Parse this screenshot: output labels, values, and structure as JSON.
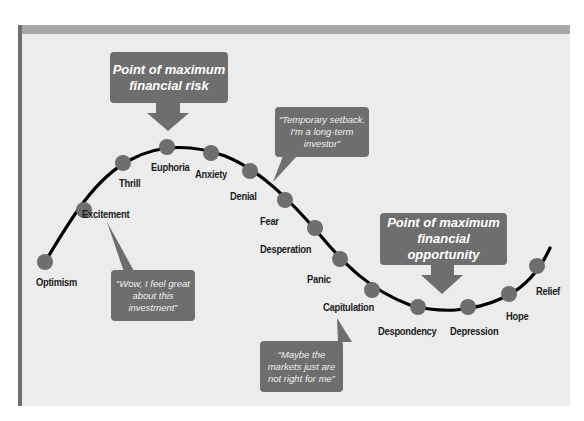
{
  "diagram": {
    "title_callouts": {
      "risk": "Point of maximum financial risk",
      "risk_lines": [
        "Point of maximum",
        "financial risk"
      ],
      "opportunity": "Point of maximum financial opportunity",
      "opportunity_lines": [
        "Point of maximum",
        "financial opportunity"
      ]
    },
    "quotes": {
      "excitement": [
        "“Wow, I feel great",
        "about this",
        "investment”"
      ],
      "denial": [
        "“Temporary setback.",
        "I'm a long-term",
        "investor”"
      ],
      "capitulation": [
        "“Maybe the",
        "markets just are",
        "not right for me”"
      ]
    },
    "stages": [
      {
        "label": "Optimism",
        "dot": [
          45,
          262
        ],
        "pos": [
          36,
          276
        ]
      },
      {
        "label": "Excitement",
        "dot": [
          84,
          210
        ],
        "pos": [
          82,
          208
        ]
      },
      {
        "label": "Thrill",
        "dot": [
          123,
          163
        ],
        "pos": [
          119,
          177
        ]
      },
      {
        "label": "Euphoria",
        "dot": [
          167,
          147
        ],
        "pos": [
          151,
          161
        ]
      },
      {
        "label": "Anxiety",
        "dot": [
          211,
          153
        ],
        "pos": [
          195,
          168
        ]
      },
      {
        "label": "Denial",
        "dot": [
          250,
          171
        ],
        "pos": [
          230,
          190
        ]
      },
      {
        "label": "Fear",
        "dot": [
          285,
          200
        ],
        "pos": [
          260,
          215
        ]
      },
      {
        "label": "Desperation",
        "dot": [
          315,
          228
        ],
        "pos": [
          260,
          243
        ]
      },
      {
        "label": "Panic",
        "dot": [
          340,
          259
        ],
        "pos": [
          307,
          273
        ]
      },
      {
        "label": "Capitulation",
        "dot": [
          372,
          290
        ],
        "pos": [
          323,
          301
        ]
      },
      {
        "label": "Despondency",
        "dot": [
          418,
          307
        ],
        "pos": [
          378,
          325
        ]
      },
      {
        "label": "Depression",
        "dot": [
          468,
          307
        ],
        "pos": [
          450,
          325
        ]
      },
      {
        "label": "Hope",
        "dot": [
          509,
          294
        ],
        "pos": [
          506,
          310
        ]
      },
      {
        "label": "Relief",
        "dot": [
          537,
          266
        ],
        "pos": [
          536,
          285
        ]
      }
    ],
    "colors": {
      "panel_bg": "#ececec",
      "top_bar": "#a8a8a8",
      "left_bar": "#6f6f6f",
      "box": "#6e6e6e",
      "dot": "#6e6e6e",
      "curve": "#000000",
      "label": "#1c1c1c"
    }
  }
}
